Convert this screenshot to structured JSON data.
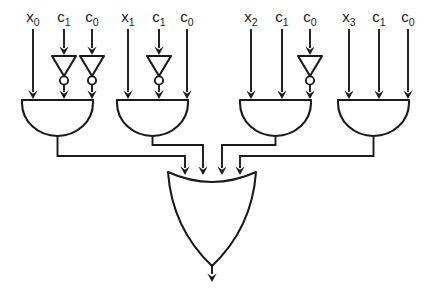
{
  "diagram": {
    "line_color": "#1a1a1a",
    "background_color": "#ffffff",
    "groups": [
      {
        "id": "group-0",
        "and_gate_name": "and-gate-0",
        "inputs": [
          {
            "base": "x",
            "sub": "0",
            "inverted": false
          },
          {
            "base": "c",
            "sub": "1",
            "inverted": true
          },
          {
            "base": "c",
            "sub": "0",
            "inverted": true
          }
        ]
      },
      {
        "id": "group-1",
        "and_gate_name": "and-gate-1",
        "inputs": [
          {
            "base": "x",
            "sub": "1",
            "inverted": false
          },
          {
            "base": "c",
            "sub": "1",
            "inverted": true
          },
          {
            "base": "c",
            "sub": "0",
            "inverted": false
          }
        ]
      },
      {
        "id": "group-2",
        "and_gate_name": "and-gate-2",
        "inputs": [
          {
            "base": "x",
            "sub": "2",
            "inverted": false
          },
          {
            "base": "c",
            "sub": "1",
            "inverted": false
          },
          {
            "base": "c",
            "sub": "0",
            "inverted": true
          }
        ]
      },
      {
        "id": "group-3",
        "and_gate_name": "and-gate-3",
        "inputs": [
          {
            "base": "x",
            "sub": "3",
            "inverted": false
          },
          {
            "base": "c",
            "sub": "1",
            "inverted": false
          },
          {
            "base": "c",
            "sub": "0",
            "inverted": false
          }
        ]
      }
    ],
    "or_gate": {
      "name": "or-gate",
      "input_count": 4,
      "output_label": ""
    }
  }
}
